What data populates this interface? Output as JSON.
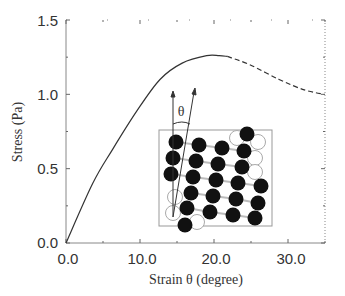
{
  "chart_data": {
    "type": "line",
    "title": "",
    "xlabel": "Strain θ (degree)",
    "ylabel": "Stress (Pa)",
    "xlim": [
      0,
      35
    ],
    "ylim": [
      0,
      1.5
    ],
    "xticks": [
      "0.0",
      "10.0",
      "20.0",
      "30.0"
    ],
    "yticks": [
      "0.0",
      "0.5",
      "1.0",
      "1.5"
    ],
    "grid": false,
    "legend": null,
    "series": [
      {
        "name": "measured (solid)",
        "style": "solid",
        "x": [
          0,
          3.6,
          6.3,
          9.6,
          12.7,
          15.7,
          19.0,
          20.7,
          21.8
        ],
        "y": [
          0,
          0.4,
          0.63,
          0.89,
          1.1,
          1.21,
          1.26,
          1.26,
          1.255
        ]
      },
      {
        "name": "extrapolated (dashed)",
        "style": "dashed",
        "x": [
          21.8,
          24.8,
          28.8,
          32.2,
          34.9
        ],
        "y": [
          1.255,
          1.2,
          1.1,
          1.03,
          1.0
        ]
      }
    ],
    "annotations": [
      {
        "type": "inset",
        "description": "Tilted particle lattice schematic with shear angle θ between vertical and tilted arrows",
        "label": "θ"
      }
    ]
  },
  "inset": {
    "angle_label": "θ",
    "filled_particles": [
      [
        176,
        142
      ],
      [
        173,
        158
      ],
      [
        171,
        174
      ],
      [
        199,
        145
      ],
      [
        196,
        161
      ],
      [
        193,
        177
      ],
      [
        191,
        193
      ],
      [
        187,
        208
      ],
      [
        185,
        225
      ],
      [
        222,
        148
      ],
      [
        218,
        164
      ],
      [
        216,
        180
      ],
      [
        213,
        196
      ],
      [
        210,
        212
      ],
      [
        247,
        134
      ],
      [
        244,
        151
      ],
      [
        242,
        167
      ],
      [
        238,
        183
      ],
      [
        236,
        199
      ],
      [
        233,
        215
      ],
      [
        261,
        186
      ],
      [
        258,
        203
      ],
      [
        255,
        218
      ]
    ],
    "hollow_particles": [
      [
        237,
        138
      ],
      [
        258,
        142
      ],
      [
        255,
        158
      ],
      [
        255,
        172
      ],
      [
        175,
        197
      ],
      [
        173,
        213
      ],
      [
        197,
        222
      ]
    ]
  }
}
